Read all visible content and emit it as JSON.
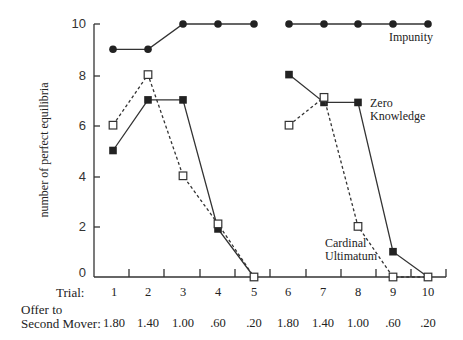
{
  "chart_data": {
    "type": "line",
    "title": "",
    "xlabel": "Trial",
    "ylabel": "number of perfect equilibria",
    "ylim": [
      0,
      10
    ],
    "yticks": [
      0,
      2,
      4,
      6,
      8,
      10
    ],
    "grid": false,
    "categories": [
      "1",
      "2",
      "3",
      "4",
      "5",
      "6",
      "7",
      "8",
      "9",
      "10"
    ],
    "offers": [
      ".80",
      "1.40",
      "1.00",
      ".60",
      ".20",
      "1.80",
      "1.40",
      "1.00",
      ".60",
      ".20"
    ],
    "offers_display": [
      "1.80",
      "1.40",
      "1.00",
      ".60",
      ".20",
      "1.80",
      "1.40",
      "1.00",
      ".60",
      ".20"
    ],
    "segments": [
      [
        1,
        5
      ],
      [
        6,
        10
      ]
    ],
    "series": [
      {
        "name": "Impunity",
        "marker": "filled-circle",
        "line": "solid",
        "values": [
          9,
          9,
          10,
          10,
          10,
          10,
          10,
          10,
          10,
          10
        ]
      },
      {
        "name": "Zero Knowledge",
        "marker": "filled-square",
        "line": "solid",
        "values": [
          5,
          7,
          7,
          2,
          0,
          8,
          7,
          7,
          1,
          0
        ]
      },
      {
        "name": "Cardinal Ultimatum",
        "marker": "open-square",
        "line": "dashed",
        "values": [
          6,
          8,
          4,
          2,
          0,
          6,
          7,
          2,
          0,
          0
        ]
      }
    ]
  },
  "labels": {
    "ylabel": "number of perfect equilibria",
    "trial_row": "Trial:",
    "offer_row_line1": "Offer to",
    "offer_row_line2": "Second Mover:",
    "impunity": "Impunity",
    "zero_line1": "Zero",
    "zero_line2": "Knowledge",
    "cardinal_line1": "Cardinal",
    "cardinal_line2": "Ultimatum"
  },
  "yticks": {
    "t0": "0",
    "t2": "2",
    "t4": "4",
    "t6": "6",
    "t8": "8",
    "t10": "10"
  },
  "trials": {
    "t1": "1",
    "t2": "2",
    "t3": "3",
    "t4": "4",
    "t5": "5",
    "t6": "6",
    "t7": "7",
    "t8": "8",
    "t9": "9",
    "t10": "10"
  },
  "offers": {
    "o1": "1.80",
    "o2": "1.40",
    "o3": "1.00",
    "o4": ".60",
    "o5": ".20",
    "o6": "1.80",
    "o7": "1.40",
    "o8": "1.00",
    "o9": ".60",
    "o10": ".20"
  }
}
